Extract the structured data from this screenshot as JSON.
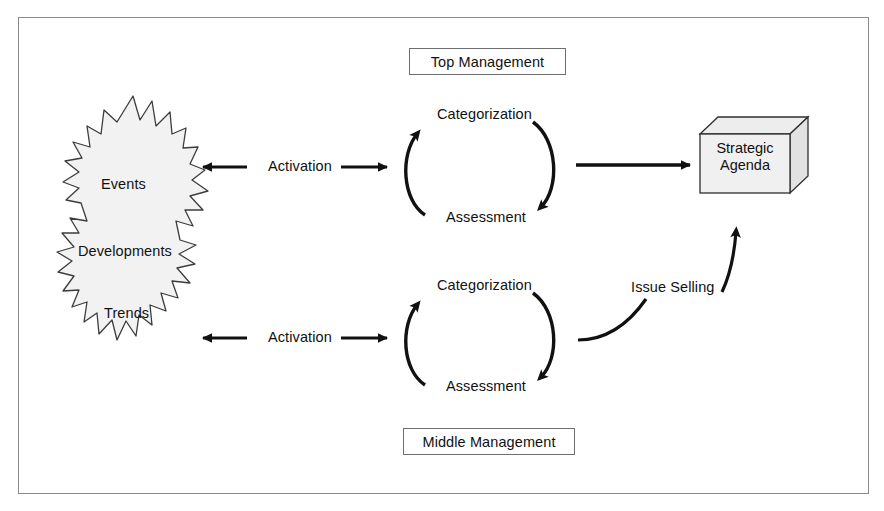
{
  "figure": {
    "frame_border_color": "#8a8a8a",
    "background_color": "#ffffff",
    "ink_color": "#111111",
    "burst_fill_color": "#f2f2f2",
    "box_fill_color": "#f0f0f0",
    "caption": ""
  },
  "boxes": {
    "top_management": "Top Management",
    "middle_management": "Middle Management",
    "strategic_agenda_line1": "Strategic",
    "strategic_agenda_line2": "Agenda"
  },
  "burst": {
    "items": [
      {
        "label": "Events"
      },
      {
        "label": "Developments"
      },
      {
        "label": "Trends"
      }
    ]
  },
  "cycles": [
    {
      "id": "top",
      "owner": "Top Management",
      "step_top": "Categorization",
      "step_bottom": "Assessment"
    },
    {
      "id": "bottom",
      "owner": "Middle Management",
      "step_top": "Categorization",
      "step_bottom": "Assessment"
    }
  ],
  "flows": {
    "activation_top": "Activation",
    "activation_bottom": "Activation",
    "issue_selling": "Issue Selling"
  }
}
